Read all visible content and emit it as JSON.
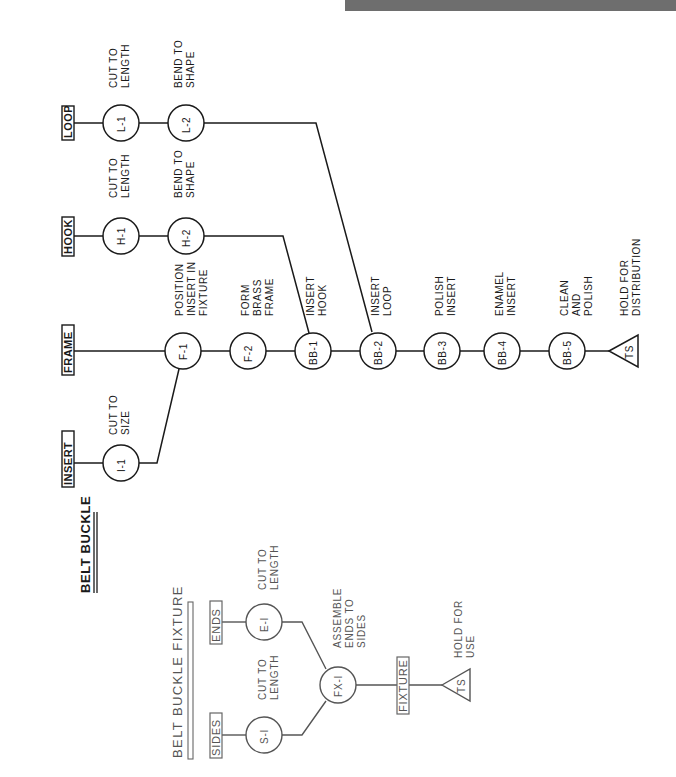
{
  "top_bar": {
    "text": ""
  },
  "belt_buckle": {
    "title": "BELT BUCKLE",
    "inputs": {
      "loop": "LOOP",
      "hook": "HOOK",
      "frame": "FRAME",
      "insert": "INSERT"
    },
    "operations": {
      "L1": {
        "id": "L-1",
        "desc": [
          "CUT TO",
          "LENGTH"
        ]
      },
      "L2": {
        "id": "L-2",
        "desc": [
          "BEND TO",
          "SHAPE"
        ]
      },
      "H1": {
        "id": "H-1",
        "desc": [
          "CUT TO",
          "LENGTH"
        ]
      },
      "H2": {
        "id": "H-2",
        "desc": [
          "BEND TO",
          "SHAPE"
        ]
      },
      "I1": {
        "id": "I-1",
        "desc": [
          "CUT TO",
          "SIZE"
        ]
      },
      "F1": {
        "id": "F-1",
        "desc": [
          "POSITION",
          "INSERT IN",
          "FIXTURE"
        ]
      },
      "F2": {
        "id": "F-2",
        "desc": [
          "FORM",
          "BRASS",
          "FRAME"
        ]
      },
      "BB1": {
        "id": "BB-1",
        "desc": [
          "INSERT",
          "HOOK"
        ]
      },
      "BB2": {
        "id": "BB-2",
        "desc": [
          "INSERT",
          "LOOP"
        ]
      },
      "BB3": {
        "id": "BB-3",
        "desc": [
          "POLISH",
          "INSERT"
        ]
      },
      "BB4": {
        "id": "BB-4",
        "desc": [
          "ENAMEL",
          "INSERT"
        ]
      },
      "BB5": {
        "id": "BB-5",
        "desc": [
          "CLEAN",
          "AND",
          "POLISH"
        ]
      }
    },
    "storage": {
      "id": "TS",
      "desc": [
        "HOLD FOR",
        "DISTRIBUTION"
      ]
    }
  },
  "belt_buckle_fixture": {
    "title": "BELT BUCKLE FIXTURE",
    "inputs": {
      "ends": "ENDS",
      "sides": "SIDES"
    },
    "operations": {
      "E1": {
        "id": "E-I",
        "desc": [
          "CUT TO",
          "LENGTH"
        ]
      },
      "S1": {
        "id": "S-I",
        "desc": [
          "CUT TO",
          "LENGTH"
        ]
      },
      "FX1": {
        "id": "FX-I",
        "desc": [
          "ASSEMBLE",
          "ENDS TO",
          "SIDES"
        ]
      }
    },
    "output": "FIXTURE",
    "storage": {
      "id": "TS",
      "desc": [
        "HOLD FOR",
        "USE"
      ]
    }
  }
}
